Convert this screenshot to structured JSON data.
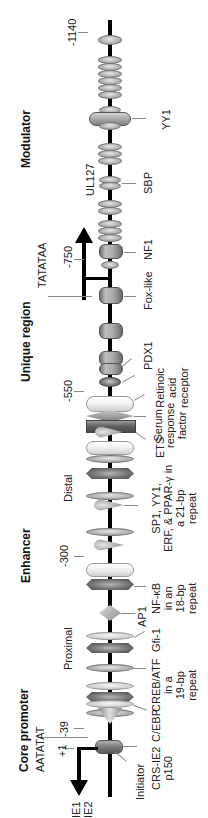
{
  "diagram": {
    "title": "",
    "regions": [
      {
        "label": "Modulator"
      },
      {
        "label": "Unique region"
      },
      {
        "label": "Enhancer"
      },
      {
        "label": "Core promoter"
      }
    ],
    "enhancer_subregions": [
      {
        "label": "Distal"
      },
      {
        "label": "Proximal"
      }
    ],
    "positions": [
      {
        "label": "-1140"
      },
      {
        "label": "-750"
      },
      {
        "label": "-550"
      },
      {
        "label": "-300"
      },
      {
        "label": "-39"
      },
      {
        "label": "+1"
      }
    ],
    "sequences": [
      {
        "label": "TATATAA"
      },
      {
        "label": "AATATAT"
      }
    ],
    "transcripts": [
      {
        "label": "IE1"
      },
      {
        "label": "IE2"
      }
    ],
    "other_labels": [
      {
        "label": "UL127"
      }
    ],
    "binding_sites": [
      {
        "label": "YY1"
      },
      {
        "label": "SBP"
      },
      {
        "label": "NF1"
      },
      {
        "label": "Fox-like"
      },
      {
        "label": "PDX1"
      },
      {
        "label": "Retinoic",
        "line2": "acid",
        "line3": "receptor"
      },
      {
        "label": "Serum",
        "line2": "response",
        "line3": "factor"
      },
      {
        "label": "ETS"
      },
      {
        "label": "SP1, YY1,",
        "line2": "ERF, & PPAR-γ in",
        "line3": "a 21-bp",
        "line4": "repeat"
      },
      {
        "label": "NF-κB",
        "line2": "in an",
        "line3": "18-bp",
        "line4": "repeat"
      },
      {
        "label": "AP1"
      },
      {
        "label": "Gfi-1"
      },
      {
        "label": "CREB/ATF",
        "line2": "in a",
        "line3": "19-bp",
        "line4": "repeat"
      },
      {
        "label": "C/EBP"
      },
      {
        "label": "CRS-IE2",
        "line2": "p150"
      },
      {
        "label": "Initiator"
      }
    ],
    "colors": {
      "axis": "#000000",
      "element_gray": "#b4b4b4",
      "element_dark": "#6d6d6d",
      "element_light": "#f0f0f0"
    }
  }
}
